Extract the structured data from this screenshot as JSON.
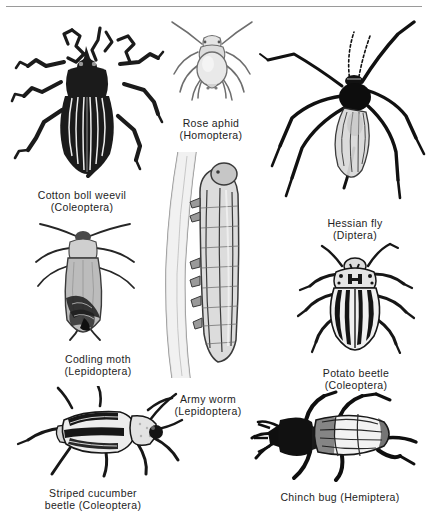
{
  "plate": {
    "title": "Insect pests plate",
    "background": "#ffffff",
    "ink": "#232323",
    "rule_color": "#9a9a9a",
    "figure_count": 8
  },
  "figures": [
    {
      "id": "cotton-boll-weevil",
      "common_name": "Cotton boll weevil",
      "order": "(Coleoptera)",
      "caption_line1": "Cotton boll weevil",
      "caption_line2": "(Coleoptera)",
      "描述": "",
      "description": "Dark striped weevil, dorsal view, long snout, six legs",
      "body_fill": "#1b1b1b",
      "stripe_color": "#ffffff"
    },
    {
      "id": "rose-aphid",
      "common_name": "Rose aphid",
      "order": "(Homoptera)",
      "caption_line1": "Rose aphid",
      "caption_line2": "(Homoptera)",
      "description": "Pale soft-bodied aphid, dorsal view, pear-shaped abdomen",
      "body_fill": "#d8d8d8",
      "stripe_color": "#6e6e6e"
    },
    {
      "id": "hessian-fly",
      "common_name": "Hessian fly",
      "order": "(Diptera)",
      "caption_line1": "Hessian fly",
      "caption_line2": "(Diptera)",
      "description": "Slender long-legged midge with veined translucent wings",
      "body_fill": "#111111",
      "stripe_color": "#bdbdbd"
    },
    {
      "id": "codling-moth",
      "common_name": "Codling moth",
      "order": "(Lepidoptera)",
      "caption_line1": "Codling moth",
      "caption_line2": "(Lepidoptera)",
      "description": "Grey moth at rest, wings folded, dark wing-tip patch",
      "body_fill": "#b9b9b9",
      "stripe_color": "#262626"
    },
    {
      "id": "army-worm",
      "common_name": "Army worm",
      "order": "(Lepidoptera)",
      "caption_line1": "Army worm",
      "caption_line2": "(Lepidoptera)",
      "description": "Striped caterpillar clinging to a vertical plant stem",
      "body_fill": "#cfcfcf",
      "stripe_color": "#3a3a3a"
    },
    {
      "id": "potato-beetle",
      "common_name": "Potato beetle",
      "order": "(Coleoptera)",
      "caption_line1": "Potato beetle",
      "caption_line2": "(Coleoptera)",
      "description": "Oval beetle with bold black longitudinal stripes on pale elytra",
      "body_fill": "#f0f0f0",
      "stripe_color": "#141414"
    },
    {
      "id": "striped-cucumber-beetle",
      "common_name": "Striped cucumber beetle",
      "order": "(Coleoptera)",
      "caption_line1": "Striped cucumber",
      "caption_line2": "beetle (Coleoptera)",
      "description": "Elongate beetle with three dark stripes, pale thorax and head",
      "body_fill": "#ededed",
      "stripe_color": "#171717"
    },
    {
      "id": "chinch-bug",
      "common_name": "Chinch bug",
      "order": "(Hemiptera)",
      "caption_line1": "Chinch bug (Hemiptera)",
      "caption_line2": "",
      "description": "Black-bodied true bug with pale veined overlapping wings",
      "body_fill": "#0f0f0f",
      "stripe_color": "#f5f5f5"
    }
  ]
}
